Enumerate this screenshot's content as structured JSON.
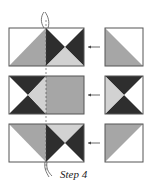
{
  "caption": "Step 4",
  "colors": {
    "dark": "#2e2e2e",
    "medium": "#a6a6a6",
    "light": "#d2d2d2",
    "white": "#ffffff",
    "outline": "#555555"
  },
  "rows": [
    {
      "name": "top-row",
      "block": "half-square left + hourglass right",
      "unit": "half-square triangle"
    },
    {
      "name": "middle-row",
      "block": "hourglass left + plain right",
      "unit": "hourglass"
    },
    {
      "name": "bottom-row",
      "block": "half-square left + hourglass right",
      "unit": "half-square triangle"
    }
  ]
}
